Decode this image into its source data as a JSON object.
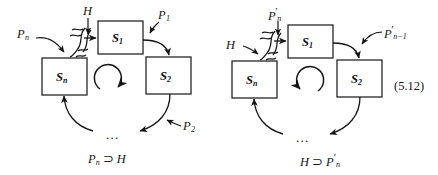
{
  "figure": {
    "equation_number": "(5.12)",
    "diagrams": [
      {
        "id": "left",
        "boxes": [
          {
            "name": "S",
            "sub": "1"
          },
          {
            "name": "S",
            "sub": "2"
          },
          {
            "name": "S",
            "sub": "n"
          }
        ],
        "annotations": [
          {
            "id": "h-top",
            "base": "H",
            "sub": "",
            "prime": false
          },
          {
            "id": "p-left",
            "base": "P",
            "sub": "n",
            "prime": false
          },
          {
            "id": "p-right",
            "base": "P",
            "sub": "1",
            "prime": false
          },
          {
            "id": "p-bottom",
            "base": "P",
            "sub": "2",
            "prime": false
          }
        ],
        "caption": {
          "left": {
            "base": "P",
            "sub": "n",
            "prime": false
          },
          "operator": "⊃",
          "right": {
            "base": "H",
            "sub": "",
            "prime": false
          }
        },
        "ellipsis": "...",
        "rotation": "clockwise"
      },
      {
        "id": "right",
        "boxes": [
          {
            "name": "S",
            "sub": "1"
          },
          {
            "name": "S",
            "sub": "2"
          },
          {
            "name": "S",
            "sub": "n"
          }
        ],
        "annotations": [
          {
            "id": "p-top",
            "base": "P",
            "sub": "n",
            "prime": true
          },
          {
            "id": "h-left",
            "base": "H",
            "sub": "",
            "prime": false
          },
          {
            "id": "p-right",
            "base": "P",
            "sub": "n−1",
            "prime": true
          }
        ],
        "caption": {
          "left": {
            "base": "H",
            "sub": "",
            "prime": false
          },
          "operator": "⊃",
          "right": {
            "base": "P",
            "sub": "n",
            "prime": true
          }
        },
        "ellipsis": "...",
        "rotation": "counter-clockwise"
      }
    ],
    "colors": {
      "ink": "#151515",
      "background": "#ffffff"
    }
  }
}
